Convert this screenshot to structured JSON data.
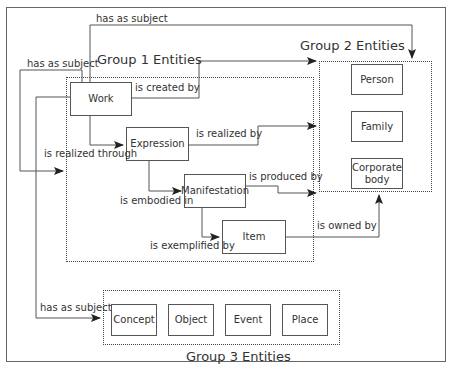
{
  "groups": {
    "group1": {
      "title": "Group 1 Entities"
    },
    "group2": {
      "title": "Group 2 Entities"
    },
    "group3": {
      "title": "Group 3 Entities"
    }
  },
  "entities": {
    "work": "Work",
    "expression": "Expression",
    "manifestation": "Manifestation",
    "item": "Item",
    "person": "Person",
    "family": "Family",
    "corporate_body": "Corporate body",
    "concept": "Concept",
    "object": "Object",
    "event": "Event",
    "place": "Place"
  },
  "relations": {
    "has_as_subject_top": "has as subject",
    "has_as_subject_left": "has as subject",
    "has_as_subject_bottom": "has as subject",
    "is_created_by": "is created by",
    "is_realized_through": "is realized through",
    "is_realized_by": "is realized by",
    "is_embodied_in": "is embodied in",
    "is_produced_by": "is produced by",
    "is_exemplified_by": "is exemplified by",
    "is_owned_by": "is owned by"
  },
  "colors": {
    "line": "#444444",
    "text": "#333333",
    "background": "#ffffff"
  }
}
